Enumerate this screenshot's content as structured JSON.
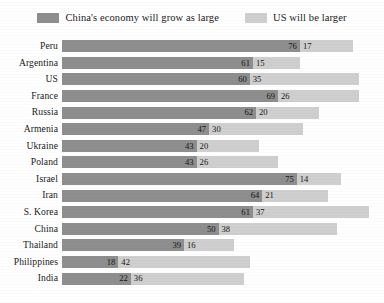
{
  "legend": {
    "items": [
      {
        "label": "China's economy will grow as large",
        "color": "#8e8e8e",
        "swatch_name": "legend-swatch-china"
      },
      {
        "label": "US will be larger",
        "color": "#cfcfcf",
        "swatch_name": "legend-swatch-us"
      }
    ]
  },
  "chart_data": {
    "type": "bar",
    "orientation": "horizontal",
    "stacked": true,
    "title": "",
    "subtitle": "",
    "xlabel": "",
    "ylabel": "",
    "grid": false,
    "legend_position": "top-center",
    "xlim": [
      0,
      100
    ],
    "categories": [
      "Peru",
      "Argentina",
      "US",
      "France",
      "Russia",
      "Armenia",
      "Ukraine",
      "Poland",
      "Israel",
      "Iran",
      "S. Korea",
      "China",
      "Thailand",
      "Philippines",
      "India"
    ],
    "series": [
      {
        "name": "China's economy will grow as large",
        "color": "#8e8e8e",
        "values": [
          76,
          61,
          60,
          69,
          62,
          47,
          43,
          43,
          75,
          64,
          61,
          50,
          39,
          18,
          22
        ]
      },
      {
        "name": "US will be larger",
        "color": "#cfcfcf",
        "values": [
          17,
          15,
          35,
          26,
          20,
          30,
          20,
          26,
          14,
          21,
          37,
          38,
          16,
          42,
          36
        ]
      }
    ],
    "rows": [
      {
        "label": "Peru",
        "china": 76,
        "us": 17
      },
      {
        "label": "Argentina",
        "china": 61,
        "us": 15
      },
      {
        "label": "US",
        "china": 60,
        "us": 35
      },
      {
        "label": "France",
        "china": 69,
        "us": 26
      },
      {
        "label": "Russia",
        "china": 62,
        "us": 20
      },
      {
        "label": "Armenia",
        "china": 47,
        "us": 30
      },
      {
        "label": "Ukraine",
        "china": 43,
        "us": 20
      },
      {
        "label": "Poland",
        "china": 43,
        "us": 26
      },
      {
        "label": "Israel",
        "china": 75,
        "us": 14
      },
      {
        "label": "Iran",
        "china": 64,
        "us": 21
      },
      {
        "label": "S. Korea",
        "china": 61,
        "us": 37
      },
      {
        "label": "China",
        "china": 50,
        "us": 38
      },
      {
        "label": "Thailand",
        "china": 39,
        "us": 16
      },
      {
        "label": "Philippines",
        "china": 18,
        "us": 42
      },
      {
        "label": "India",
        "china": 22,
        "us": 36
      }
    ]
  }
}
